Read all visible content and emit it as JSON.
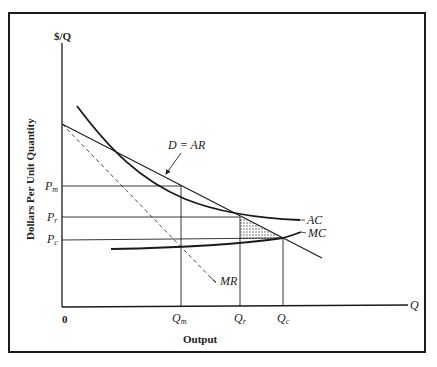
{
  "diagram": {
    "type": "economics-natural-monopoly-regulation",
    "y_axis_top_label": "$/Q",
    "y_axis_title": "Dollars Per Unit Quantity",
    "x_axis_end_label": "Q",
    "x_axis_title": "Output",
    "origin_label": "0",
    "price_labels": {
      "pm": "P",
      "pm_sub": "m",
      "pr": "P",
      "pr_sub": "r",
      "pc": "P",
      "pc_sub": "c"
    },
    "quantity_labels": {
      "qm": "Q",
      "qm_sub": "m",
      "qr": "Q",
      "qr_sub": "r",
      "qc": "Q",
      "qc_sub": "c"
    },
    "curves": {
      "demand": "D = AR",
      "marginal_revenue": "MR",
      "average_cost": "AC",
      "marginal_cost": "MC"
    },
    "shaded_region": "deadweight-loss triangle between Qr and Qc",
    "colors": {
      "ink": "#1a1a1a",
      "background": "#ffffff"
    }
  }
}
